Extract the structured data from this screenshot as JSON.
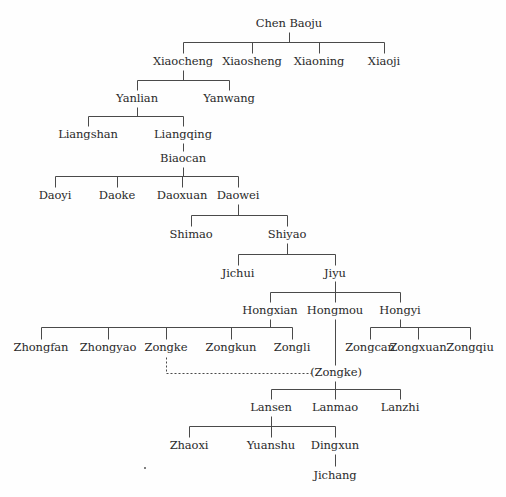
{
  "diagram": {
    "type": "family-tree",
    "line_color": "#4a4a4a",
    "nodes": [
      {
        "id": "chen_baoju",
        "label": "Chen Baoju",
        "x": 289,
        "y": 24
      },
      {
        "id": "xiaocheng",
        "label": "Xiaocheng",
        "x": 183,
        "y": 62
      },
      {
        "id": "xiaosheng",
        "label": "Xiaosheng",
        "x": 252,
        "y": 62
      },
      {
        "id": "xiaoning",
        "label": "Xiaoning",
        "x": 319,
        "y": 62
      },
      {
        "id": "xiaoji",
        "label": "Xiaoji",
        "x": 384,
        "y": 62
      },
      {
        "id": "yanlian",
        "label": "Yanlian",
        "x": 137,
        "y": 99
      },
      {
        "id": "yanwang",
        "label": "Yanwang",
        "x": 229,
        "y": 99
      },
      {
        "id": "liangshan",
        "label": "Liangshan",
        "x": 88,
        "y": 135
      },
      {
        "id": "liangqing",
        "label": "Liangqing",
        "x": 183,
        "y": 135
      },
      {
        "id": "biaocan",
        "label": "Biaocan",
        "x": 183,
        "y": 159
      },
      {
        "id": "daoyi",
        "label": "Daoyi",
        "x": 55,
        "y": 196
      },
      {
        "id": "daoke",
        "label": "Daoke",
        "x": 117,
        "y": 196
      },
      {
        "id": "daoxuan",
        "label": "Daoxuan",
        "x": 182,
        "y": 196
      },
      {
        "id": "daowei",
        "label": "Daowei",
        "x": 238,
        "y": 196
      },
      {
        "id": "shimao",
        "label": "Shimao",
        "x": 191,
        "y": 235
      },
      {
        "id": "shiyao",
        "label": "Shiyao",
        "x": 287,
        "y": 235
      },
      {
        "id": "jichui",
        "label": "Jichui",
        "x": 238,
        "y": 274
      },
      {
        "id": "jiyu",
        "label": "Jiyu",
        "x": 335,
        "y": 274
      },
      {
        "id": "hongxian",
        "label": "Hongxian",
        "x": 270,
        "y": 311
      },
      {
        "id": "hongmou",
        "label": "Hongmou",
        "x": 335,
        "y": 311
      },
      {
        "id": "hongyi",
        "label": "Hongyi",
        "x": 400,
        "y": 311
      },
      {
        "id": "zhongfan",
        "label": "Zhongfan",
        "x": 41,
        "y": 348
      },
      {
        "id": "zhongyao",
        "label": "Zhongyao",
        "x": 108,
        "y": 348
      },
      {
        "id": "zongke",
        "label": "Zongke",
        "x": 166,
        "y": 348
      },
      {
        "id": "zongkun",
        "label": "Zongkun",
        "x": 231,
        "y": 348
      },
      {
        "id": "zongli",
        "label": "Zongli",
        "x": 292,
        "y": 348
      },
      {
        "id": "zongcan",
        "label": "Zongcan",
        "x": 370,
        "y": 348
      },
      {
        "id": "zongxuan",
        "label": "Zongxuan",
        "x": 418,
        "y": 348
      },
      {
        "id": "zongqiu",
        "label": "Zongqiu",
        "x": 470,
        "y": 348
      },
      {
        "id": "zongke_adopted",
        "label": "(Zongke)",
        "x": 336,
        "y": 373
      },
      {
        "id": "lansen",
        "label": "Lansen",
        "x": 271,
        "y": 408
      },
      {
        "id": "lanmao",
        "label": "Lanmao",
        "x": 335,
        "y": 408
      },
      {
        "id": "lanzhi",
        "label": "Lanzhi",
        "x": 400,
        "y": 408
      },
      {
        "id": "zhaoxi",
        "label": "Zhaoxi",
        "x": 189,
        "y": 446
      },
      {
        "id": "yuanshu",
        "label": "Yuanshu",
        "x": 271,
        "y": 446
      },
      {
        "id": "dingxun",
        "label": "Dingxun",
        "x": 335,
        "y": 446
      },
      {
        "id": "jichang",
        "label": "Jichang",
        "x": 335,
        "y": 476
      }
    ],
    "solid_lines": [
      [
        289,
        32,
        289,
        42
      ],
      [
        183,
        42,
        384,
        42
      ],
      [
        183,
        42,
        183,
        53
      ],
      [
        252,
        42,
        252,
        53
      ],
      [
        319,
        42,
        319,
        53
      ],
      [
        384,
        42,
        384,
        53
      ],
      [
        183,
        70,
        183,
        80
      ],
      [
        137,
        80,
        229,
        80
      ],
      [
        137,
        80,
        137,
        90
      ],
      [
        229,
        80,
        229,
        90
      ],
      [
        137,
        107,
        137,
        116
      ],
      [
        88,
        116,
        183,
        116
      ],
      [
        88,
        116,
        88,
        126
      ],
      [
        183,
        116,
        183,
        126
      ],
      [
        183,
        143,
        183,
        151
      ],
      [
        183,
        167,
        183,
        176
      ],
      [
        55,
        176,
        238,
        176
      ],
      [
        55,
        176,
        55,
        187
      ],
      [
        117,
        176,
        117,
        187
      ],
      [
        182,
        176,
        182,
        187
      ],
      [
        238,
        176,
        238,
        187
      ],
      [
        238,
        204,
        238,
        215
      ],
      [
        191,
        215,
        287,
        215
      ],
      [
        191,
        215,
        191,
        226
      ],
      [
        287,
        215,
        287,
        226
      ],
      [
        287,
        243,
        287,
        254
      ],
      [
        238,
        254,
        335,
        254
      ],
      [
        238,
        254,
        238,
        265
      ],
      [
        335,
        254,
        335,
        265
      ],
      [
        335,
        281,
        335,
        292
      ],
      [
        270,
        292,
        400,
        292
      ],
      [
        270,
        292,
        270,
        302
      ],
      [
        335,
        292,
        335,
        302
      ],
      [
        400,
        292,
        400,
        302
      ],
      [
        270,
        319,
        270,
        327
      ],
      [
        41,
        327,
        292,
        327
      ],
      [
        41,
        327,
        41,
        339
      ],
      [
        108,
        327,
        108,
        339
      ],
      [
        166,
        327,
        166,
        339
      ],
      [
        231,
        327,
        231,
        339
      ],
      [
        292,
        327,
        292,
        339
      ],
      [
        400,
        319,
        400,
        327
      ],
      [
        370,
        327,
        470,
        327
      ],
      [
        370,
        327,
        370,
        339
      ],
      [
        418,
        327,
        418,
        339
      ],
      [
        470,
        327,
        470,
        339
      ],
      [
        335,
        319,
        335,
        365
      ],
      [
        335,
        381,
        335,
        389
      ],
      [
        271,
        389,
        400,
        389
      ],
      [
        271,
        389,
        271,
        399
      ],
      [
        335,
        389,
        335,
        399
      ],
      [
        400,
        389,
        400,
        399
      ],
      [
        271,
        416,
        271,
        426
      ],
      [
        189,
        426,
        335,
        426
      ],
      [
        189,
        426,
        189,
        437
      ],
      [
        271,
        426,
        271,
        437
      ],
      [
        335,
        426,
        335,
        437
      ],
      [
        335,
        454,
        335,
        466
      ]
    ],
    "dashed_lines": [
      [
        166,
        357,
        166,
        373
      ],
      [
        166,
        373,
        311,
        373
      ]
    ]
  }
}
